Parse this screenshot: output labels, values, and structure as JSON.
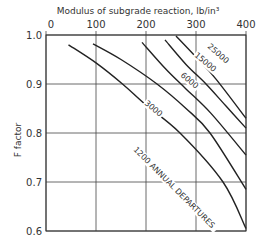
{
  "chart_data": {
    "type": "line",
    "title": "Modulus of subgrade reaction, lb/in³",
    "xlabel": "Modulus of subgrade reaction, lb/in³",
    "ylabel": "F factor",
    "xlim": [
      0,
      400
    ],
    "ylim": [
      0.6,
      1.0
    ],
    "x_ticks": [
      "0",
      "100",
      "200",
      "300",
      "400"
    ],
    "y_ticks": [
      "1.0",
      "0.9",
      "0.8",
      "0.7",
      "0.6"
    ],
    "x_axis_position": "top",
    "grid": true,
    "series": [
      {
        "name": "1200 ANNUAL DEPARTURES",
        "label": "1200 ANNUAL DEPARTURES",
        "x": [
          45,
          100,
          153,
          200,
          268,
          354,
          400
        ],
        "y": [
          0.98,
          0.943,
          0.9,
          0.857,
          0.8,
          0.7,
          0.605
        ]
      },
      {
        "name": "3000",
        "label": "3000",
        "x": [
          94,
          150,
          222,
          280,
          328,
          400
        ],
        "y": [
          0.982,
          0.95,
          0.9,
          0.85,
          0.8,
          0.685
        ]
      },
      {
        "name": "6000",
        "label": "6000",
        "x": [
          192,
          240,
          280,
          330,
          400
        ],
        "y": [
          0.985,
          0.93,
          0.89,
          0.84,
          0.755
        ]
      },
      {
        "name": "15000",
        "label": "15000",
        "x": [
          238,
          280,
          320,
          360,
          400
        ],
        "y": [
          0.99,
          0.94,
          0.9,
          0.855,
          0.81
        ]
      },
      {
        "name": "25000",
        "label": "25000",
        "x": [
          260,
          300,
          340,
          400
        ],
        "y": [
          0.998,
          0.955,
          0.91,
          0.83
        ]
      }
    ]
  }
}
